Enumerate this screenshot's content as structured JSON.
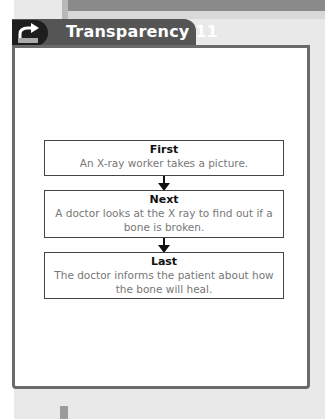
{
  "header": {
    "icon": "transparency-icon",
    "title": "Transparency 11"
  },
  "flowchart": {
    "steps": [
      {
        "label": "First",
        "text": "An X-ray worker takes a picture."
      },
      {
        "label": "Next",
        "text": "A doctor looks at the X ray to find out if a bone is broken."
      },
      {
        "label": "Last",
        "text": "The doctor informs the patient about how the bone will heal."
      }
    ]
  },
  "colors": {
    "header_bg": "#555555",
    "icon_bg": "#1e1e1e",
    "card_border": "#6a6a6a"
  }
}
